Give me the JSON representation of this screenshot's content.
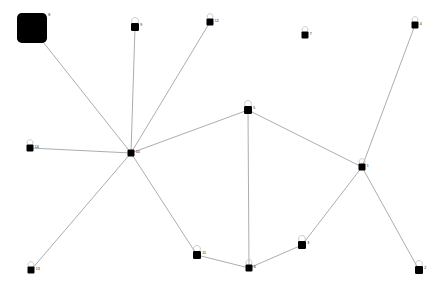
{
  "chart_data": {
    "type": "scatter",
    "title": "",
    "xlabel": "",
    "ylabel": "",
    "grid": false,
    "legend": null,
    "xlim": [
      0,
      444
    ],
    "ylim": [
      0,
      289
    ],
    "graph": {
      "directed": false,
      "node_count": 15,
      "edge_count": 14,
      "node_shape": "rounded-square",
      "node_color": "#000000",
      "edge_color": "#8a8a8a",
      "loop_color": "#b4b4b4",
      "background": "#ffffff",
      "nodes": [
        {
          "id": "8",
          "label": "8",
          "x": 32,
          "y": 28,
          "size": 30,
          "self_loop": false
        },
        {
          "id": "9",
          "label": "9",
          "x": 135,
          "y": 27,
          "size": 8,
          "self_loop": true
        },
        {
          "id": "12",
          "label": "12",
          "x": 210,
          "y": 22,
          "size": 7,
          "self_loop": true
        },
        {
          "id": "7",
          "label": "7",
          "x": 305,
          "y": 35,
          "size": 7,
          "self_loop": true
        },
        {
          "id": "4",
          "label": "4",
          "x": 415,
          "y": 25,
          "size": 7,
          "self_loop": true
        },
        {
          "id": "5",
          "label": "5",
          "x": 248,
          "y": 110,
          "size": 8,
          "self_loop": true
        },
        {
          "id": "10",
          "label": "10",
          "x": 131,
          "y": 153,
          "size": 7,
          "self_loop": false
        },
        {
          "id": "14",
          "label": "14",
          "x": 30,
          "y": 148,
          "size": 7,
          "self_loop": true
        },
        {
          "id": "1",
          "label": "1",
          "x": 362,
          "y": 167,
          "size": 7,
          "self_loop": true
        },
        {
          "id": "11",
          "label": "11",
          "x": 197,
          "y": 255,
          "size": 8,
          "self_loop": true
        },
        {
          "id": "6",
          "label": "6",
          "x": 249,
          "y": 268,
          "size": 7,
          "self_loop": true
        },
        {
          "id": "3",
          "label": "3",
          "x": 302,
          "y": 245,
          "size": 8,
          "self_loop": true
        },
        {
          "id": "2",
          "label": "2",
          "x": 419,
          "y": 270,
          "size": 8,
          "self_loop": true
        },
        {
          "id": "13",
          "label": "13",
          "x": 31,
          "y": 270,
          "size": 7,
          "self_loop": true
        },
        {
          "id": "0",
          "label": "0",
          "x": 131,
          "y": 153,
          "size": 0,
          "self_loop": false
        }
      ],
      "edges": [
        {
          "source": "8",
          "target": "10"
        },
        {
          "source": "9",
          "target": "10"
        },
        {
          "source": "12",
          "target": "10"
        },
        {
          "source": "14",
          "target": "10"
        },
        {
          "source": "13",
          "target": "10"
        },
        {
          "source": "11",
          "target": "10"
        },
        {
          "source": "5",
          "target": "10"
        },
        {
          "source": "5",
          "target": "6"
        },
        {
          "source": "5",
          "target": "1"
        },
        {
          "source": "11",
          "target": "6"
        },
        {
          "source": "6",
          "target": "3"
        },
        {
          "source": "3",
          "target": "1"
        },
        {
          "source": "1",
          "target": "4"
        },
        {
          "source": "1",
          "target": "2"
        }
      ]
    }
  }
}
